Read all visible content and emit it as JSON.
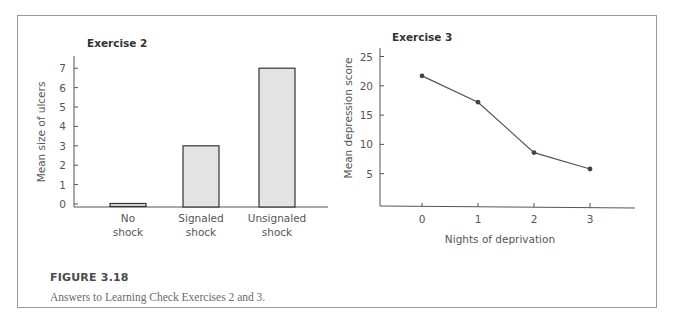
{
  "figure": {
    "label": "FIGURE 3.18",
    "caption": "Answers to Learning Check Exercises 2 and 3."
  },
  "chart_data": [
    {
      "type": "bar",
      "title": "Exercise 2",
      "categories": [
        "No shock",
        "Signaled shock",
        "Unsignaled shock"
      ],
      "category_lines": [
        [
          "No",
          "shock"
        ],
        [
          "Signaled",
          "shock"
        ],
        [
          "Unsignaled",
          "shock"
        ]
      ],
      "values": [
        0,
        3,
        7
      ],
      "xlabel": "",
      "ylabel": "Mean size of ulcers",
      "yticks": [
        0,
        1,
        2,
        3,
        4,
        5,
        6,
        7
      ],
      "ylim": [
        0,
        7.5
      ],
      "grid": false,
      "bar_color": "#e3e3e3"
    },
    {
      "type": "line",
      "title": "Exercise 3",
      "x": [
        0,
        1,
        2,
        3
      ],
      "xticks": [
        "0",
        "1",
        "2",
        "3"
      ],
      "values": [
        21.7,
        17.2,
        8.6,
        5.8
      ],
      "xlabel": "Nights of deprivation",
      "ylabel": "Mean depression score",
      "yticks": [
        5,
        10,
        15,
        20,
        25
      ],
      "ylim": [
        0,
        26
      ],
      "grid": false,
      "line_color": "#555555"
    }
  ]
}
